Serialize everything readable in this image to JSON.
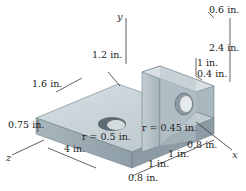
{
  "diagram": {
    "type": "isometric-machine-part",
    "axes": {
      "x": "x",
      "y": "y",
      "z": "z"
    },
    "dimensions": {
      "top_thickness": "0.6 in.",
      "upright_height": "2.4 in.",
      "hole_height": "1 in.",
      "hole_offset": "0.4 in.",
      "hole_edge_dist": "1.2 in.",
      "plate_depth": "1.6 in.",
      "plate_thickness": "0.75 in.",
      "plate_length": "4 in.",
      "seg_1": "0.8 in.",
      "seg_2": "1 in.",
      "seg_3": "1 in.",
      "seg_4": "0.8 in."
    },
    "radii": {
      "plate_hole": "r = 0.5 in.",
      "upright_hole": "r = 0.45 in."
    },
    "colors": {
      "top_face": "#c9d3d8",
      "front_face": "#9eadb5",
      "side_face": "#b4c0c6",
      "hole": "#5e6c74",
      "background": "#ffffff"
    }
  }
}
